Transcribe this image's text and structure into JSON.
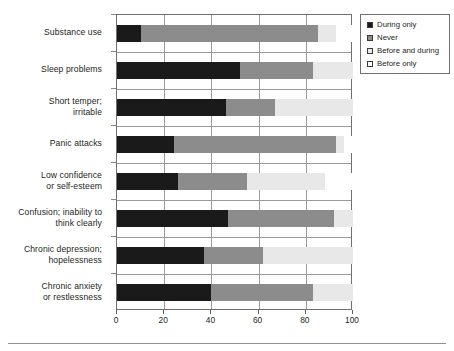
{
  "chart_data": {
    "type": "bar",
    "orientation": "horizontal",
    "stacked": true,
    "title": "",
    "xlabel": "",
    "ylabel": "",
    "xlim": [
      0,
      100
    ],
    "xticks": [
      0,
      20,
      40,
      60,
      80,
      100
    ],
    "grid": true,
    "legend_position": "top-right",
    "categories": [
      "Substance use",
      "Sleep problems",
      "Short temper; irritable",
      "Panic attacks",
      "Low confidence or self-esteem",
      "Confusion; inability to think clearly",
      "Chronic depression; hopelessness",
      "Chronic anxiety or restlessness"
    ],
    "category_label_lines": [
      [
        "Substance use"
      ],
      [
        "Sleep problems"
      ],
      [
        "Short temper;",
        "irritable"
      ],
      [
        "Panic attacks"
      ],
      [
        "Low confidence",
        "or self-esteem"
      ],
      [
        "Confusion; inability to",
        "think clearly"
      ],
      [
        "Chronic depression;",
        "hopelessness"
      ],
      [
        "Chronic anxiety",
        "or restlessness"
      ]
    ],
    "series": [
      {
        "name": "During only",
        "color": "#1a1a1a",
        "values": [
          10,
          52,
          46,
          24,
          26,
          47,
          37,
          40
        ]
      },
      {
        "name": "Never",
        "color": "#8c8c8c",
        "values": [
          75,
          31,
          21,
          69,
          29,
          45,
          25,
          43
        ]
      },
      {
        "name": "Before and during",
        "color": "#e8e8e8",
        "values": [
          8,
          17,
          33,
          3,
          33,
          8,
          38,
          17
        ]
      },
      {
        "name": "Before only",
        "color": "#ffffff",
        "values": [
          7,
          0,
          0,
          4,
          12,
          0,
          0,
          0
        ]
      }
    ],
    "cumulative_boundaries": [
      [
        10,
        85,
        93,
        100
      ],
      [
        52,
        83,
        100,
        100
      ],
      [
        46,
        67,
        100,
        100
      ],
      [
        24,
        93,
        96,
        100
      ],
      [
        26,
        55,
        88,
        100
      ],
      [
        47,
        92,
        100,
        100
      ],
      [
        37,
        62,
        100,
        100
      ],
      [
        40,
        83,
        100,
        100
      ]
    ]
  },
  "legend": {
    "items": [
      {
        "label": "During only",
        "swatch": "during-only"
      },
      {
        "label": "Never",
        "swatch": "never"
      },
      {
        "label": "Before and during",
        "swatch": "before-and-during"
      },
      {
        "label": "Before only",
        "swatch": "before-only"
      }
    ]
  },
  "axis": {
    "x_tick_labels": [
      "0",
      "20",
      "40",
      "60",
      "80",
      "100"
    ]
  },
  "colors": {
    "during_only": "#1a1a1a",
    "never": "#8c8c8c",
    "before_and_during": "#e8e8e8",
    "before_only": "#ffffff",
    "frame": "#6f6f6f",
    "grid": "#9a9a9a",
    "text": "#231f20"
  }
}
